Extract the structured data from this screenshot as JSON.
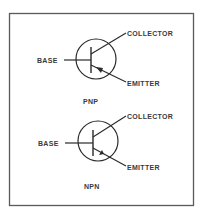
{
  "diagram": {
    "border_color": "#5a5a5a",
    "line_color": "#2a2a2a",
    "transistors": [
      {
        "type_label": "PNP",
        "base_label": "BASE",
        "collector_label": "COLLECTOR",
        "emitter_label": "EMITTER",
        "arrow_direction": "toward base"
      },
      {
        "type_label": "NPN",
        "base_label": "BASE",
        "collector_label": "COLLECTOR",
        "emitter_label": "EMITTER",
        "arrow_direction": "away from base"
      }
    ]
  }
}
